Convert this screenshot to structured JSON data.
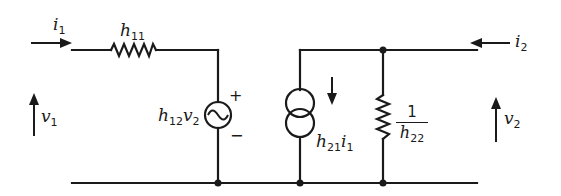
{
  "diagram": {
    "type": "circuit",
    "title": "",
    "components": [
      {
        "id": "h11",
        "kind": "resistor",
        "label": "h11"
      },
      {
        "id": "vsrc",
        "kind": "ac-voltage-source",
        "label": "h12v2",
        "polarity_top": "+",
        "polarity_bottom": "−"
      },
      {
        "id": "isrc",
        "kind": "dependent-current-source",
        "label": "h21i1",
        "direction": "down"
      },
      {
        "id": "h22",
        "kind": "resistor",
        "label": "1/h22"
      }
    ],
    "port1": {
      "current": "i1",
      "voltage": "v1"
    },
    "port2": {
      "current": "i2",
      "voltage": "v2"
    }
  },
  "labels": {
    "i1": {
      "base": "i",
      "sub": "1"
    },
    "v1": {
      "base": "v",
      "sub": "1"
    },
    "h11": {
      "base": "h",
      "sub": "11"
    },
    "h12v2": {
      "base1": "h",
      "sub1": "12",
      "base2": "v",
      "sub2": "2"
    },
    "plus": "+",
    "minus": "−",
    "h21i1": {
      "base1": "h",
      "sub1": "21",
      "base2": "i",
      "sub2": "1"
    },
    "h22": {
      "num": "1",
      "den_base": "h",
      "den_sub": "22"
    },
    "i2": {
      "base": "i",
      "sub": "2"
    },
    "v2": {
      "base": "v",
      "sub": "2"
    }
  },
  "colors": {
    "ink": "#1a1a1a",
    "background": "#ffffff"
  }
}
